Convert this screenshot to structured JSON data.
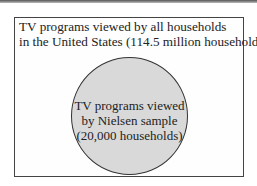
{
  "diagram": {
    "type": "venn-subset",
    "outer_set": {
      "line1": "TV programs viewed by all households",
      "line2": "in the United States (114.5 million households)"
    },
    "inner_set": {
      "line1": "TV programs viewed",
      "line2": "by Nielsen sample",
      "line3": "(20,000 households)"
    },
    "colors": {
      "circle_fill": "#d9d9d9",
      "border": "#444444",
      "background": "#ffffff"
    }
  }
}
